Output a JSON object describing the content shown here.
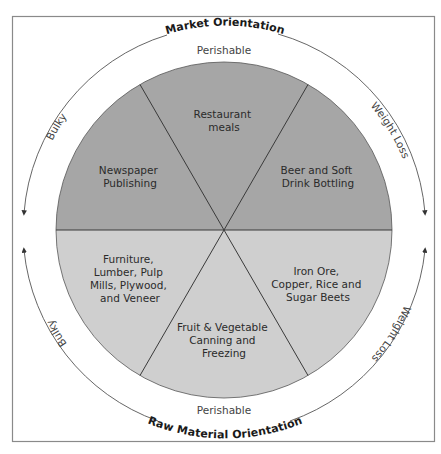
{
  "diagram": {
    "top_orientation": "Market Orientation",
    "bottom_orientation": "Raw Material Orientation",
    "top_perishable": "Perishable",
    "bottom_perishable": "Perishable",
    "left_top_side": "Bulky",
    "left_bottom_side": "Bulky",
    "right_top_side": "Weight Loss",
    "right_bottom_side": "Weight Loss",
    "colors": {
      "upper_half": "#a6a6a6",
      "lower_half": "#cfcfcf",
      "lines": "#3a3a3a",
      "frame": "#8a8a8a"
    },
    "segments": [
      {
        "position": "top",
        "half": "market",
        "lines": [
          "Restaurant",
          "meals"
        ]
      },
      {
        "position": "upper-left",
        "half": "market",
        "lines": [
          "Newspaper",
          "Publishing"
        ]
      },
      {
        "position": "upper-right",
        "half": "market",
        "lines": [
          "Beer and Soft",
          "Drink Bottling"
        ]
      },
      {
        "position": "lower-left",
        "half": "raw-material",
        "lines": [
          "Furniture,",
          "Lumber, Pulp",
          "Mills, Plywood,",
          "and Veneer"
        ]
      },
      {
        "position": "bottom",
        "half": "raw-material",
        "lines": [
          "Fruit & Vegetable",
          "Canning and",
          "Freezing"
        ]
      },
      {
        "position": "lower-right",
        "half": "raw-material",
        "lines": [
          "Iron Ore,",
          "Copper, Rice and",
          "Sugar Beets"
        ]
      }
    ]
  }
}
